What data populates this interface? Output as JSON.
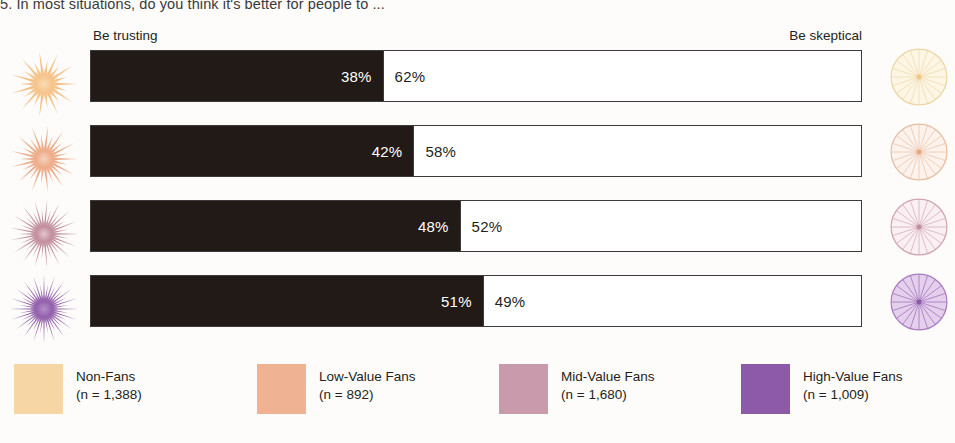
{
  "chart_title": "5. In most situations, do you think it's better for people to ...",
  "axis": {
    "left_label": "Be trusting",
    "right_label": "Be skeptical"
  },
  "colors": {
    "bar_left_fill": "#221a16",
    "bar_right_fill": "#ffffff",
    "bar_outline": "#3b3b3b",
    "non_fans": "#f7d6a6",
    "low_value_fans": "#efb393",
    "mid_value_fans": "#c99aac",
    "high_value_fans": "#8c5aa8",
    "background": "#fdfcfa"
  },
  "rows": [
    {
      "group": "Non-Fans",
      "trusting_label": "38%",
      "skeptical_label": "62%",
      "trusting": 38,
      "skeptical": 62,
      "icon_left": "starburst-icon-non-fans",
      "icon_right": "wheel-icon-non-fans",
      "color": "#f7d6a6"
    },
    {
      "group": "Low-Value Fans",
      "trusting_label": "42%",
      "skeptical_label": "58%",
      "trusting": 42,
      "skeptical": 58,
      "icon_left": "starburst-icon-low-value-fans",
      "icon_right": "wheel-icon-low-value-fans",
      "color": "#efb393"
    },
    {
      "group": "Mid-Value Fans",
      "trusting_label": "48%",
      "skeptical_label": "52%",
      "trusting": 48,
      "skeptical": 52,
      "icon_left": "starburst-icon-mid-value-fans",
      "icon_right": "wheel-icon-mid-value-fans",
      "color": "#c99aac"
    },
    {
      "group": "High-Value Fans",
      "trusting_label": "51%",
      "skeptical_label": "49%",
      "trusting": 51,
      "skeptical": 49,
      "icon_left": "starburst-icon-high-value-fans",
      "icon_right": "wheel-icon-high-value-fans",
      "color": "#8c5aa8"
    }
  ],
  "legend": [
    {
      "label": "Non-Fans",
      "n": "(n = 1,388)",
      "color": "#f7d6a6"
    },
    {
      "label": "Low-Value Fans",
      "n": "(n = 892)",
      "color": "#efb393"
    },
    {
      "label": "Mid-Value Fans",
      "n": "(n = 1,680)",
      "color": "#c99aac"
    },
    {
      "label": "High-Value Fans",
      "n": "(n = 1,009)",
      "color": "#8c5aa8"
    }
  ],
  "chart_data": {
    "type": "bar",
    "title": "5. In most situations, do you think it's better for people to ...",
    "subtitle": "",
    "xlabel": "",
    "ylabel": "",
    "orientation": "horizontal",
    "stacked": true,
    "stacked_100_percent": true,
    "xlim": [
      0,
      100
    ],
    "grid": false,
    "legend_position": "bottom",
    "categories": [
      "Non-Fans",
      "Low-Value Fans",
      "Mid-Value Fans",
      "High-Value Fans"
    ],
    "category_counts": [
      1388,
      892,
      1680,
      1009
    ],
    "series": [
      {
        "name": "Be trusting",
        "values": [
          38,
          42,
          48,
          51
        ],
        "color": "#221a16"
      },
      {
        "name": "Be skeptical",
        "values": [
          62,
          58,
          52,
          49
        ],
        "color": "#ffffff"
      }
    ],
    "data_labels": [
      [
        "38%",
        "62%"
      ],
      [
        "42%",
        "58%"
      ],
      [
        "48%",
        "52%"
      ],
      [
        "51%",
        "49%"
      ]
    ],
    "annotations": [
      "Be trusting",
      "Be skeptical"
    ]
  }
}
